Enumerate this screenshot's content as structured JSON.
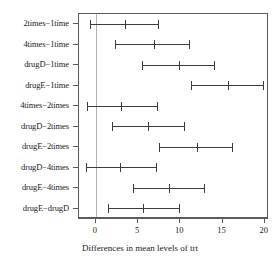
{
  "chart_data": {
    "type": "scatter",
    "title": "",
    "xlabel": "Differences in mean levels of trt",
    "ylabel": "",
    "xlim": [
      -2.0,
      20.5
    ],
    "xticks": [
      0,
      5,
      10,
      15,
      20
    ],
    "xtick_labels": [
      "0",
      "5",
      "10",
      "15",
      "20"
    ],
    "grid": false,
    "reference_line": 0,
    "legend": "none",
    "comparisons": [
      {
        "label": "2times−1time",
        "center": 3.4,
        "lower": -0.7,
        "upper": 7.4
      },
      {
        "label": "4times−1time",
        "center": 6.9,
        "lower": 2.3,
        "upper": 11.0
      },
      {
        "label": "drugD−1time",
        "center": 9.8,
        "lower": 5.5,
        "upper": 14.0
      },
      {
        "label": "drugE−1time",
        "center": 15.6,
        "lower": 11.3,
        "upper": 19.8
      },
      {
        "label": "4times−2times",
        "center": 3.0,
        "lower": -1.1,
        "upper": 7.2
      },
      {
        "label": "drugD−2times",
        "center": 6.2,
        "lower": 1.9,
        "upper": 10.4
      },
      {
        "label": "drugE−2times",
        "center": 12.0,
        "lower": 7.5,
        "upper": 16.1
      },
      {
        "label": "drugD−4times",
        "center": 2.9,
        "lower": -1.2,
        "upper": 7.1
      },
      {
        "label": "drugE−4times",
        "center": 8.6,
        "lower": 4.4,
        "upper": 12.8
      },
      {
        "label": "drugE−drugD",
        "center": 5.6,
        "lower": 1.4,
        "upper": 9.9
      }
    ]
  },
  "colors": {
    "frame": "#5a5a5a",
    "interval": "#3c3c3c",
    "reference": "#b0b0b0",
    "background": "#ffffff"
  }
}
